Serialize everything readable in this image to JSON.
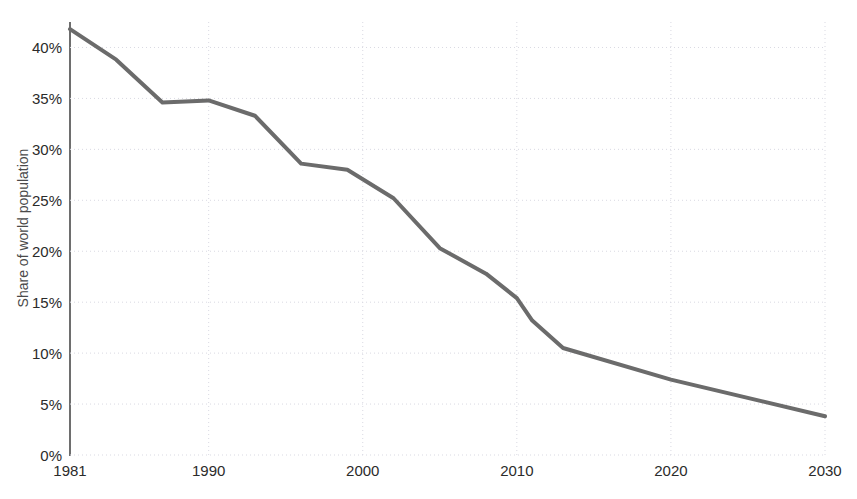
{
  "chart_data": {
    "type": "line",
    "title": "",
    "subtitle": "",
    "xlabel": "",
    "ylabel": "Share of world population",
    "xlim": [
      1981,
      2030
    ],
    "ylim": [
      0,
      42.5
    ],
    "grid": true,
    "legend": null,
    "xticks": [
      1981,
      1990,
      2000,
      2010,
      2020,
      2030
    ],
    "xticklabels": [
      "1981",
      "1990",
      "2000",
      "2010",
      "2020",
      "2030"
    ],
    "yticks": [
      0,
      5,
      10,
      15,
      20,
      25,
      30,
      35,
      40
    ],
    "yticklabels": [
      "0%",
      "5%",
      "10%",
      "15%",
      "20%",
      "25%",
      "30%",
      "35%",
      "40%"
    ],
    "series": [
      {
        "name": "Share of world population in extreme poverty",
        "color": "#6b6b6b",
        "linewidth": 4,
        "x": [
          1981,
          1984,
          1987,
          1990,
          1993,
          1996,
          1999,
          2002,
          2005,
          2008,
          2010,
          2011,
          2013,
          2020,
          2030
        ],
        "values": [
          41.8,
          38.8,
          34.6,
          34.8,
          33.3,
          28.6,
          28.0,
          25.2,
          20.3,
          17.8,
          15.4,
          13.2,
          10.5,
          7.4,
          3.8
        ]
      }
    ]
  },
  "axes": {
    "y_title": "Share of world population",
    "tick_color": "#2b2b2b",
    "spine_color": "#6e6e6e",
    "grid_color": "#d9d9e2"
  }
}
